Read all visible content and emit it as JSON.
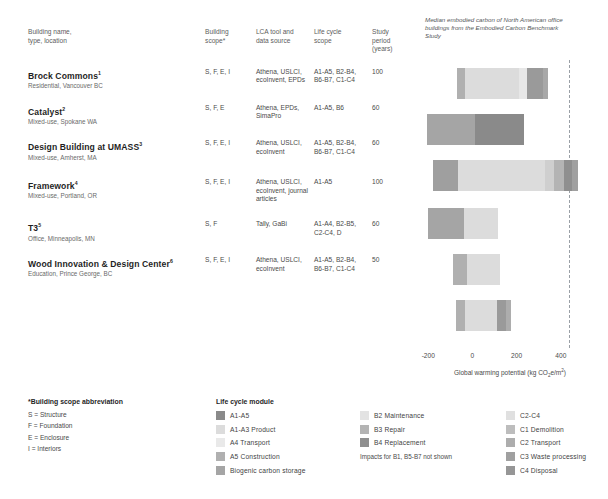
{
  "table": {
    "headers": {
      "name": "Building name,\ntype, location",
      "scope": "Building\nscope*",
      "tool": "LCA tool and\ndata source",
      "life": "Life cycle\nscope",
      "study": "Study period\n(years)"
    },
    "header_name_l1": "Building name,",
    "header_name_l2": "type, location",
    "header_scope_l1": "Building",
    "header_scope_l2": "scope*",
    "header_tool_l1": "LCA tool and",
    "header_tool_l2": "data source",
    "header_life_l1": "Life cycle",
    "header_life_l2": "scope",
    "header_study_l1": "Study period",
    "header_study_l2": "(years)",
    "rows": [
      {
        "name": "Brock Commons",
        "note": "1",
        "sub": "Residential, Vancouver BC",
        "scope": "S, F, E, I",
        "tool": "Athena, USLCI, ecoInvent, EPDs",
        "life": "A1-A5, B2-B4, B6-B7, C1-C4",
        "study": "100"
      },
      {
        "name": "Catalyst",
        "note": "2",
        "sub": "Mixed-use, Spokane WA",
        "scope": "S, F, E",
        "tool": "Athena, EPDs, SimaPro",
        "life": "A1-A5, B6",
        "study": "60"
      },
      {
        "name": "Design Building at UMASS",
        "note": "3",
        "sub": "Mixed-use, Amherst, MA",
        "scope": "S, F, E, I",
        "tool": "Athena, USLCI, ecoInvent",
        "life": "A1-A5, B2-B4, B6-B7, C1-C4",
        "study": "60"
      },
      {
        "name": "Framework",
        "note": "4",
        "sub": "Mixed-use, Portland, OR",
        "scope": "S, F, E, I",
        "tool": "Athena, USLCI, ecoInvent, journal articles",
        "life": "A1-A5",
        "study": "100"
      },
      {
        "name": "T3",
        "note": "5",
        "sub": "Office, Minneapolis, MN",
        "scope": "S, F",
        "tool": "Tally, GaBi",
        "life": "A1-A4, B2-B5, C2-C4, D",
        "study": "60"
      },
      {
        "name": "Wood Innovation & Design Center",
        "note": "6",
        "sub": "Education, Prince George, BC",
        "scope": "S, F, E, I",
        "tool": "Athena, USLCI, ecoInvent",
        "life": "A1-A5, B2-B4, B6-B7, C1-C4",
        "study": "50"
      }
    ]
  },
  "chart_data": {
    "type": "bar",
    "orientation": "horizontal",
    "stacked": true,
    "title": "",
    "annotation": "Median embodied carbon of North American office buildings from the Embodied Carbon Benchmark Study",
    "xlabel": "Global warming potential (kg CO₂e/m²)",
    "xlabel_prefix": "Global warming potential (kg CO",
    "xlabel_sub": "2",
    "xlabel_mid": "e/m",
    "xlabel_sup": "2",
    "xlabel_suffix": ")",
    "xlim": [
      -260,
      600
    ],
    "xticks": [
      -200,
      0,
      200,
      400
    ],
    "xticklabels": [
      "-200",
      "0",
      "200",
      "400"
    ],
    "grid": false,
    "reference_line": {
      "value": 435,
      "style": "dashed",
      "label": "Embodied Carbon Benchmark Study median"
    },
    "categories": [
      "Brock Commons",
      "Catalyst",
      "Design Building at UMASS",
      "Framework",
      "T3",
      "Wood Innovation & Design Center"
    ],
    "bars": [
      {
        "category": "Brock Commons",
        "start": -70,
        "end": 340,
        "segments": [
          {
            "module": "A5 Construction",
            "from": -70,
            "to": -35,
            "color": "#b0b0b0"
          },
          {
            "module": "A1-A3 Product",
            "from": -35,
            "to": 210,
            "color": "#dcdcdc"
          },
          {
            "module": "A4 Transport",
            "from": 210,
            "to": 245,
            "color": "#e7e7e7"
          },
          {
            "module": "B4 Replacement",
            "from": 245,
            "to": 320,
            "color": "#9a9a9a"
          },
          {
            "module": "C2 Transport",
            "from": 320,
            "to": 340,
            "color": "#a8a8a8"
          }
        ]
      },
      {
        "category": "Catalyst",
        "start": -205,
        "end": 235,
        "segments": [
          {
            "module": "Biogenic carbon storage",
            "from": -205,
            "to": 10,
            "color": "#a5a5a5"
          },
          {
            "module": "A1-A5",
            "from": 10,
            "to": 235,
            "color": "#8a8a8a"
          }
        ]
      },
      {
        "category": "Design Building at UMASS",
        "start": -180,
        "end": 480,
        "segments": [
          {
            "module": "A5 Construction",
            "from": -180,
            "to": -65,
            "color": "#9f9f9f"
          },
          {
            "module": "A1-A3 Product",
            "from": -65,
            "to": 330,
            "color": "#dcdcdc"
          },
          {
            "module": "A4 Transport",
            "from": 330,
            "to": 370,
            "color": "#cfcfcf"
          },
          {
            "module": "B3 Repair",
            "from": 370,
            "to": 415,
            "color": "#b4b4b4"
          },
          {
            "module": "B4 Replacement",
            "from": 415,
            "to": 450,
            "color": "#8f8f8f"
          },
          {
            "module": "C3 Waste processing",
            "from": 450,
            "to": 480,
            "color": "#a0a0a0"
          }
        ]
      },
      {
        "category": "Framework",
        "start": -200,
        "end": 115,
        "segments": [
          {
            "module": "Biogenic carbon storage",
            "from": -200,
            "to": -40,
            "color": "#a5a5a5"
          },
          {
            "module": "A1-A5",
            "from": -40,
            "to": 115,
            "color": "#dcdcdc"
          }
        ]
      },
      {
        "category": "T3",
        "start": -90,
        "end": 125,
        "segments": [
          {
            "module": "A5 Construction",
            "from": -90,
            "to": -25,
            "color": "#b0b0b0"
          },
          {
            "module": "A1-A3 Product",
            "from": -25,
            "to": 125,
            "color": "#dcdcdc"
          }
        ]
      },
      {
        "category": "Wood Innovation & Design Center",
        "start": -75,
        "end": 175,
        "segments": [
          {
            "module": "A5 Construction",
            "from": -75,
            "to": -35,
            "color": "#b0b0b0"
          },
          {
            "module": "A1-A3 Product",
            "from": -35,
            "to": 110,
            "color": "#dcdcdc"
          },
          {
            "module": "B4 Replacement",
            "from": 110,
            "to": 150,
            "color": "#9a9a9a"
          },
          {
            "module": "C2 Transport",
            "from": 150,
            "to": 175,
            "color": "#adadad"
          }
        ]
      }
    ]
  },
  "legend": {
    "scope": {
      "title": "*Building scope abbreviation",
      "lines": [
        "S = Structure",
        "F = Foundation",
        "E = Enclosure",
        "I = Interiors"
      ]
    },
    "modules": {
      "title": "Life cycle module",
      "col1": [
        {
          "label": "A1-A5",
          "color": "#8a8a8a"
        },
        {
          "label": "A1-A3 Product",
          "color": "#dcdcdc"
        },
        {
          "label": "A4 Transport",
          "color": "#e9e9e9"
        },
        {
          "label": "A5 Construction",
          "color": "#b0b0b0"
        },
        {
          "label": "Biogenic carbon storage",
          "color": "#a5a5a5"
        }
      ],
      "col2": [
        {
          "label": "B2 Maintenance",
          "color": "#e3e3e3"
        },
        {
          "label": "B3 Repair",
          "color": "#b4b4b4"
        },
        {
          "label": "B4 Replacement",
          "color": "#8f8f8f"
        }
      ],
      "col2_note": "Impacts for B1, B5-B7 not shown",
      "col3": [
        {
          "label": "C2-C4",
          "color": "#e0e0e0"
        },
        {
          "label": "C1 Demolition",
          "color": "#bdbdbd"
        },
        {
          "label": "C2 Transport",
          "color": "#adadad"
        },
        {
          "label": "C3 Waste processing",
          "color": "#a0a0a0"
        },
        {
          "label": "C4 Disposal",
          "color": "#969696"
        }
      ]
    }
  }
}
